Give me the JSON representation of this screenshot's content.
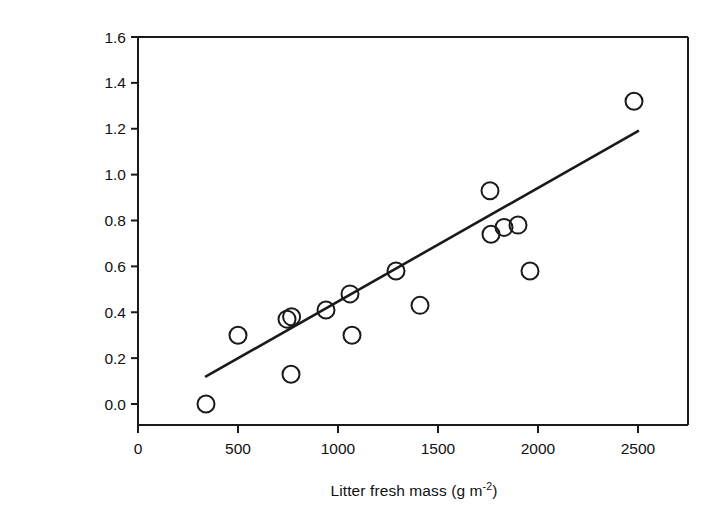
{
  "figure": {
    "background": "#ffffff",
    "line_color": "#1a1a1a",
    "marker_color": "#1a1a1a",
    "marker_fill": "none"
  },
  "axes": {
    "x_title_main": "Litter fresh mass (g m",
    "x_title_exp": "-2",
    "x_title_tail": ")",
    "y_title_main": "Increment in soil respiration (µmol m",
    "y_title_exp1": "-2",
    "y_title_mid": " s",
    "y_title_exp2": "-1",
    "y_title_tail": ")",
    "x_ticks": [
      "0",
      "500",
      "1000",
      "1500",
      "2000",
      "2500"
    ],
    "y_ticks": [
      "0.0",
      "0.2",
      "0.4",
      "0.6",
      "0.8",
      "1.0",
      "1.2",
      "1.4",
      "1.6"
    ]
  },
  "chart_data": {
    "type": "scatter",
    "title": "",
    "xlabel": "Litter fresh mass (g m-2)",
    "ylabel": "Increment in soil respiration (µmol m-2 s-1)",
    "xlim": [
      0,
      2750
    ],
    "ylim": [
      0.0,
      1.6
    ],
    "xticks": [
      0,
      500,
      1000,
      1500,
      2000,
      2500
    ],
    "yticks": [
      0.0,
      0.2,
      0.4,
      0.6,
      0.8,
      1.0,
      1.2,
      1.4,
      1.6
    ],
    "grid": false,
    "legend": null,
    "marker": "open-circle",
    "x": [
      340,
      500,
      745,
      768,
      765,
      940,
      1060,
      1070,
      1290,
      1410,
      1760,
      1765,
      1830,
      1900,
      1960,
      2480
    ],
    "y": [
      0.0,
      0.3,
      0.37,
      0.38,
      0.13,
      0.41,
      0.48,
      0.3,
      0.58,
      0.43,
      0.93,
      0.74,
      0.77,
      0.78,
      0.58,
      1.32
    ],
    "series": [
      {
        "name": "observations",
        "type": "scatter",
        "points": [
          {
            "x": 340,
            "y": 0.0
          },
          {
            "x": 500,
            "y": 0.3
          },
          {
            "x": 745,
            "y": 0.37
          },
          {
            "x": 768,
            "y": 0.38
          },
          {
            "x": 765,
            "y": 0.13
          },
          {
            "x": 940,
            "y": 0.41
          },
          {
            "x": 1060,
            "y": 0.48
          },
          {
            "x": 1070,
            "y": 0.3
          },
          {
            "x": 1290,
            "y": 0.58
          },
          {
            "x": 1410,
            "y": 0.43
          },
          {
            "x": 1760,
            "y": 0.93
          },
          {
            "x": 1765,
            "y": 0.74
          },
          {
            "x": 1830,
            "y": 0.77
          },
          {
            "x": 1900,
            "y": 0.78
          },
          {
            "x": 1960,
            "y": 0.58
          },
          {
            "x": 2480,
            "y": 1.32
          }
        ]
      },
      {
        "name": "regression-line",
        "type": "line",
        "points": [
          {
            "x": 340,
            "y": 0.12
          },
          {
            "x": 2500,
            "y": 1.19
          }
        ]
      }
    ]
  }
}
